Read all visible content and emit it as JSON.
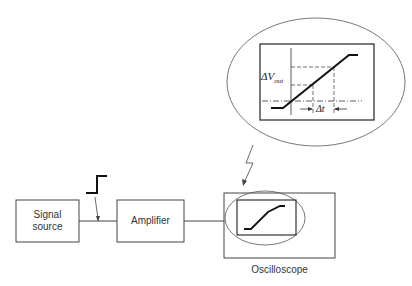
{
  "blocks": {
    "signal_source": "Signal\nsource",
    "signal_source_line1": "Signal",
    "signal_source_line2": "source",
    "amplifier": "Amplifier",
    "oscilloscope": "Oscilloscope"
  },
  "magnified_view": {
    "delta_v_label": "ΔV",
    "delta_v_sub": "out",
    "delta_t_label": "Δt"
  },
  "colors": {
    "line": "#333333",
    "trace": "#111111",
    "background": "#ffffff"
  }
}
